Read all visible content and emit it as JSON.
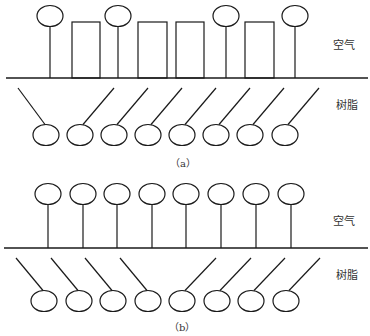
{
  "panels": [
    {
      "id": "a",
      "caption": "（a）",
      "labels": {
        "air": "空气",
        "resin": "树脂"
      },
      "baseline": {
        "x1": 6,
        "x2": 368,
        "y": 78
      },
      "top_circles_x": [
        50,
        118,
        226,
        295
      ],
      "top_circle_y": 16,
      "rects": [
        [
          72,
          100
        ],
        [
          138,
          167
        ],
        [
          176,
          204
        ],
        [
          245,
          274
        ]
      ],
      "rect_top": 22,
      "bottom_circles_x": [
        46,
        80,
        114,
        148,
        182,
        216,
        250,
        285
      ],
      "bottom_circle_y": 135,
      "bottom_tilt": [
        "left",
        "right",
        "right",
        "right",
        "right",
        "right",
        "right",
        "right"
      ]
    },
    {
      "id": "b",
      "caption": "（b）",
      "labels": {
        "air": "空气",
        "resin": "树脂"
      },
      "baseline": {
        "x1": 4,
        "x2": 368,
        "y": 248
      },
      "top_circles_x": [
        48,
        83,
        117,
        152,
        186,
        221,
        256,
        291
      ],
      "top_circle_y": 194,
      "bottom_circles_x": [
        44,
        79,
        113,
        148,
        182,
        217,
        251,
        286
      ],
      "bottom_circle_y": 301,
      "bottom_tilt": [
        "left",
        "left",
        "left",
        "left",
        "right",
        "right",
        "right",
        "right"
      ]
    }
  ]
}
